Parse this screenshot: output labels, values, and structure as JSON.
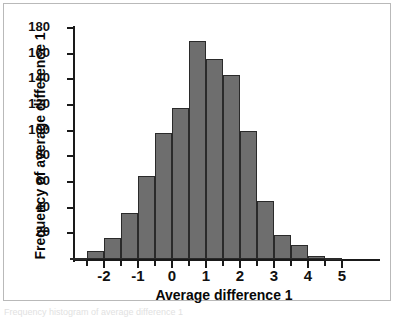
{
  "figure": {
    "caption_sliver": "Frequency histogram of average difference 1"
  },
  "chart_data": {
    "type": "bar",
    "title": "",
    "xlabel": "Average difference 1",
    "ylabel": "Frequency of average difference 1",
    "xlim": [
      -2.75,
      5.25
    ],
    "ylim": [
      0,
      186
    ],
    "grid": false,
    "legend": "none",
    "bin_width": 0.5,
    "bar_color": "#6e6e6e",
    "bar_edge_color": "#2a2a2a",
    "axis_color": "#1a1a1a",
    "x_tick_labels": [
      "-2",
      "-1",
      "0",
      "1",
      "2",
      "3",
      "4",
      "5"
    ],
    "x_tick_values": [
      -2,
      -1,
      0,
      1,
      2,
      3,
      4,
      5
    ],
    "x_minor_tick_values": [
      -2.5,
      -1.5,
      -0.5,
      0.5,
      1.5,
      2.5,
      3.5,
      4.5
    ],
    "y_tick_labels": [
      "20",
      "40",
      "60",
      "80",
      "100",
      "120",
      "140",
      "160",
      "180"
    ],
    "y_tick_values": [
      20,
      40,
      60,
      80,
      100,
      120,
      140,
      160,
      180
    ],
    "categories": [
      "-2.75",
      "-2.25",
      "-1.75",
      "-1.25",
      "-0.75",
      "-0.25",
      "0.25",
      "0.75",
      "1.25",
      "1.75",
      "2.25",
      "2.75",
      "3.25",
      "3.75",
      "4.25",
      "4.75"
    ],
    "bin_centers": [
      -2.75,
      -2.25,
      -1.75,
      -1.25,
      -0.75,
      -0.25,
      0.25,
      0.75,
      1.25,
      1.75,
      2.25,
      2.75,
      3.25,
      3.75,
      4.25,
      4.75
    ],
    "values": [
      1,
      6,
      16,
      36,
      65,
      98,
      118,
      170,
      156,
      143,
      100,
      45,
      19,
      11,
      2,
      1
    ]
  }
}
